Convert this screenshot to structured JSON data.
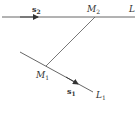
{
  "diagram": {
    "lines": [
      {
        "name": "L2",
        "label": "L",
        "subscript": "2",
        "vector_label": "s",
        "vector_subscript": "2"
      },
      {
        "name": "L1",
        "label": "L",
        "subscript": "1",
        "vector_label": "s",
        "vector_subscript": "1"
      }
    ],
    "points": [
      {
        "name": "M2",
        "label": "M",
        "subscript": "2",
        "on_line": "L2"
      },
      {
        "name": "M1",
        "label": "M",
        "subscript": "1",
        "on_line": "L1"
      }
    ],
    "segments": [
      {
        "from": "M1",
        "to": "M2"
      }
    ],
    "colors": {
      "stroke": "#555555",
      "text": "#333333",
      "background": "#ffffff"
    }
  }
}
